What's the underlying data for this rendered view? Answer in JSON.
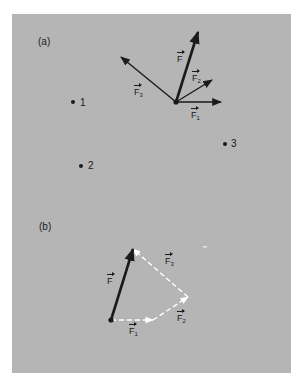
{
  "figure": {
    "background_color": "#b5b5b5",
    "part_a": {
      "label": "(a)",
      "origin": [
        176,
        102
      ],
      "vectors": [
        {
          "name": "F",
          "symbol": "F",
          "subscript": "",
          "tip": [
            198,
            32
          ],
          "style": "bold",
          "color": "#1a1a1a"
        },
        {
          "name": "F1",
          "symbol": "F",
          "subscript": "1",
          "tip": [
            221,
            102
          ],
          "style": "normal",
          "color": "#1a1a1a"
        },
        {
          "name": "F2",
          "symbol": "F",
          "subscript": "2",
          "tip": [
            212,
            80
          ],
          "style": "normal",
          "color": "#1a1a1a"
        },
        {
          "name": "F3",
          "symbol": "F",
          "subscript": "3",
          "tip": [
            121,
            57
          ],
          "style": "normal",
          "color": "#1a1a1a"
        }
      ],
      "points": [
        {
          "label": "1",
          "pos": [
            73,
            102
          ]
        },
        {
          "label": "2",
          "pos": [
            81,
            166
          ]
        },
        {
          "label": "3",
          "pos": [
            225,
            144
          ]
        }
      ]
    },
    "part_b": {
      "label": "(b)",
      "origin": [
        111,
        320
      ],
      "resultant": {
        "name": "F",
        "symbol": "F",
        "subscript": "",
        "tip": [
          133,
          249
        ],
        "color": "#1a1a1a"
      },
      "chain": [
        {
          "name": "F1",
          "symbol": "F",
          "subscript": "1",
          "from": [
            111,
            320
          ],
          "to": [
            153,
            320
          ],
          "style": "dashed",
          "color": "#ffffff"
        },
        {
          "name": "F2",
          "symbol": "F",
          "subscript": "2",
          "from": [
            153,
            320
          ],
          "to": [
            188,
            297
          ],
          "style": "dashed",
          "color": "#ffffff"
        },
        {
          "name": "F3",
          "symbol": "F",
          "subscript": "3",
          "from": [
            188,
            297
          ],
          "to": [
            133,
            249
          ],
          "style": "dashed",
          "color": "#ffffff"
        }
      ]
    }
  }
}
